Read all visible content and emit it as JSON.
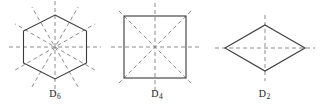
{
  "figure": {
    "background_color": "#ffffff",
    "outline_color": "#3a3a3a",
    "mirror_line_color": "#8c8c8c",
    "label_color": "#1a1a1a",
    "width": 322,
    "height": 110,
    "panels": [
      {
        "id": "d6",
        "label_symbol": "D",
        "label_subscript": "6",
        "label_text": "D6",
        "shape": "hexagon",
        "shape_orientation": "flat-top-vertex",
        "vertices": 6,
        "mirror_lines": 6,
        "mirror_rays": 12,
        "rotation_order": 6,
        "center_x": 55,
        "center_y": 47,
        "circumradius": 37,
        "mirror_extent": 46
      },
      {
        "id": "d4",
        "label_symbol": "D",
        "label_subscript": "4",
        "label_text": "D4",
        "shape": "square",
        "shape_orientation": "axis-aligned",
        "vertices": 4,
        "mirror_lines": 4,
        "mirror_rays": 8,
        "rotation_order": 4,
        "center_x": 48,
        "center_y": 47,
        "half_side": 31,
        "mirror_extent": 43
      },
      {
        "id": "d2",
        "label_symbol": "D",
        "label_subscript": "2",
        "label_text": "D2",
        "shape": "rhombus",
        "shape_orientation": "horizontal-major-axis",
        "vertices": 4,
        "mirror_lines": 2,
        "mirror_rays": 4,
        "rotation_order": 2,
        "center_x": 58,
        "center_y": 48,
        "half_width": 40,
        "half_height": 23,
        "mirror_extent_x": 50,
        "mirror_extent_y": 33
      }
    ]
  }
}
